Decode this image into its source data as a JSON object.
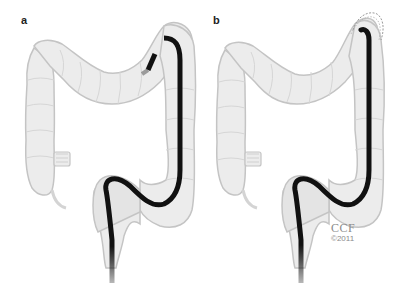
{
  "figure": {
    "panels": [
      {
        "id": "a",
        "label": "a",
        "description": "Colonoscope advanced through sigmoid and descending colon with tip at the splenic flexure"
      },
      {
        "id": "b",
        "label": "b",
        "description": "Colonoscope tip deflected at splenic flexure (retroflexed) with dotted outline showing alternate position"
      }
    ],
    "credit": {
      "org": "CCF",
      "year": "©2011"
    }
  },
  "colors": {
    "background": "#ffffff",
    "colon_fill": "#ececec",
    "colon_outline": "#c4c4c4",
    "colon_haustra": "#d6d6d6",
    "scope": "#111111",
    "label": "#222222",
    "credit": "#8a8a8a"
  }
}
